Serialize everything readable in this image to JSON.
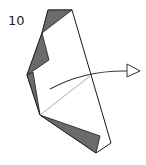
{
  "diagram": {
    "type": "origami-step",
    "step_number": "10",
    "colors": {
      "paper_front": "#ffffff",
      "paper_back": "#6b6b6b",
      "lines": "#1a1a1a",
      "crease": "#888888"
    },
    "annotations": [
      "fold arrow pointing right (turn over / swing flap)"
    ]
  }
}
